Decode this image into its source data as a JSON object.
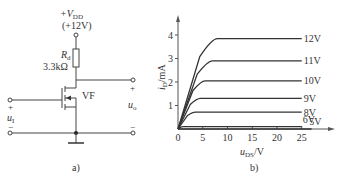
{
  "circuit": {
    "supply_label": "+V",
    "supply_sub": "DD",
    "supply_value": "(+12V)",
    "resistor_label": "R",
    "resistor_sub": "d",
    "resistor_value": "3.3kΩ",
    "transistor_label": "VF",
    "input_label": "u",
    "input_sub": "I",
    "input_plus": "+",
    "input_minus": "−",
    "output_label": "u",
    "output_sub": "o",
    "output_plus": "+",
    "output_minus": "−",
    "caption": "a)"
  },
  "chart_data": {
    "type": "line",
    "title": "",
    "caption": "b)",
    "xlabel": "u",
    "xlabel_sub": "DS",
    "xlabel_unit": "/V",
    "ylabel": "i",
    "ylabel_sub": "D",
    "ylabel_unit": "/mA",
    "xlim": [
      0,
      30
    ],
    "ylim": [
      0,
      4.5
    ],
    "xticks": [
      0,
      5,
      10,
      15,
      20,
      25
    ],
    "xtick_labels": [
      "0",
      "5",
      "10",
      "15",
      "20",
      "25"
    ],
    "yticks": [
      1,
      2,
      3,
      4
    ],
    "ytick_labels": [
      "1",
      "2",
      "3",
      "4"
    ],
    "grid": false,
    "legend": "inline-right",
    "series": [
      {
        "name": "12V",
        "saturation_mA": 3.85,
        "knee_V": 8
      },
      {
        "name": "11V",
        "saturation_mA": 2.9,
        "knee_V": 7
      },
      {
        "name": "10V",
        "saturation_mA": 2.05,
        "knee_V": 5.5
      },
      {
        "name": "9V",
        "saturation_mA": 1.3,
        "knee_V": 4.5
      },
      {
        "name": "8V",
        "saturation_mA": 0.72,
        "knee_V": 3.5
      },
      {
        "name": "6V",
        "saturation_mA": 0.1,
        "knee_V": 1
      },
      {
        "name": "5V",
        "saturation_mA": 0.0,
        "knee_V": 0.5
      }
    ]
  }
}
